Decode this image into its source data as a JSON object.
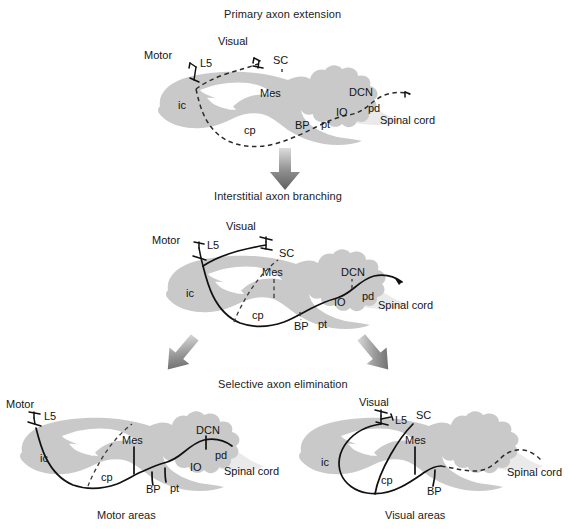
{
  "figure": {
    "background_color": "#ffffff",
    "brain_fill": "#c9c9c9",
    "axon_color": "#111111"
  },
  "stages": [
    {
      "id": "stage-1",
      "title": "Primary axon extension",
      "axon_style": "dashed",
      "labels": {
        "motor": "Motor",
        "visual": "Visual",
        "l5": "L5",
        "sc": "SC",
        "mes": "Mes",
        "ic": "ic",
        "cp": "cp",
        "bp": "BP",
        "pt": "pt",
        "io": "IO",
        "dcn": "DCN",
        "pd": "pd",
        "spinal_cord": "Spinal cord"
      }
    },
    {
      "id": "stage-2",
      "title": "Interstitial axon branching",
      "axon_style": "solid-with-dashed-branches",
      "labels": {
        "motor": "Motor",
        "visual": "Visual",
        "l5": "L5",
        "sc": "SC",
        "mes": "Mes",
        "ic": "ic",
        "cp": "cp",
        "bp": "BP",
        "pt": "pt",
        "io": "IO",
        "dcn": "DCN",
        "pd": "pd",
        "spinal_cord": "Spinal cord"
      }
    },
    {
      "id": "stage-3",
      "title": "Selective axon elimination",
      "axon_style": "solid",
      "panels": [
        {
          "id": "panel-motor",
          "caption": "Motor areas",
          "labels": {
            "motor": "Motor",
            "l5": "L5",
            "mes": "Mes",
            "ic": "ic",
            "cp": "cp",
            "bp": "BP",
            "pt": "pt",
            "io": "IO",
            "dcn": "DCN",
            "pd": "pd",
            "spinal_cord": "Spinal cord"
          }
        },
        {
          "id": "panel-visual",
          "caption": "Visual areas",
          "labels": {
            "visual": "Visual",
            "l5": "L5",
            "sc": "SC",
            "mes": "Mes",
            "ic": "ic",
            "cp": "cp",
            "bp": "BP",
            "spinal_cord": "Spinal cord"
          }
        }
      ]
    }
  ],
  "arrows": [
    {
      "id": "arrow-stage1-to-stage2",
      "direction": "down"
    },
    {
      "id": "arrow-stage2-to-motor",
      "direction": "down-left"
    },
    {
      "id": "arrow-stage2-to-visual",
      "direction": "down-right"
    }
  ]
}
